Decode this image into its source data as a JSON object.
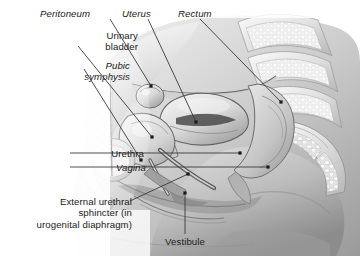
{
  "figure": {
    "type": "anatomical-illustration",
    "rendering": "grayscale pencil / airbrush medical illustration",
    "width": 360,
    "height": 256,
    "background_color": "#ffffff",
    "ink_color": "#1b1b1b",
    "leader_color": "#3a3a3a",
    "tone_light": "#f2f2f2",
    "tone_mid": "#c9c9c9",
    "tone_dark": "#8e8e8e",
    "tone_deep": "#5e5e5e"
  },
  "labels": [
    {
      "id": "peritoneum",
      "text": "Peritoneum",
      "style": "italic",
      "align": "left",
      "x": 40,
      "y": 8,
      "leader": {
        "from": [
          110,
          19
        ],
        "to": [
          151,
          86
        ],
        "dot": true
      }
    },
    {
      "id": "uterus",
      "text": "Uterus",
      "style": "italic",
      "align": "left",
      "x": 122,
      "y": 8,
      "leader": {
        "from": [
          148,
          19
        ],
        "to": [
          196,
          122
        ],
        "dot": true
      }
    },
    {
      "id": "rectum",
      "text": "Rectum",
      "style": "italic",
      "align": "left",
      "x": 178,
      "y": 8,
      "leader": {
        "from": [
          200,
          19
        ],
        "to": [
          281,
          102
        ],
        "dot": true
      }
    },
    {
      "id": "urinary-bladder",
      "text": "Urinary\nbladder",
      "lines": [
        "Urinary",
        "bladder"
      ],
      "style": "normal",
      "align": "right",
      "x": 18,
      "y": 30,
      "leader": {
        "from": [
          78,
          46
        ],
        "to": [
          152,
          137
        ],
        "dot": true
      }
    },
    {
      "id": "pubic-symphysis",
      "text": "Pubic\nsymphysis",
      "lines": [
        "Pubic",
        "symphysis"
      ],
      "style": "italic",
      "align": "right",
      "x": 10,
      "y": 60,
      "leader": {
        "from": [
          84,
          69
        ],
        "to": [
          141,
          160
        ],
        "dot": true
      }
    },
    {
      "id": "urethra",
      "text": "Urethra",
      "style": "normal",
      "align": "right",
      "x": 24,
      "y": 148,
      "leader": {
        "from": [
          70,
          153
        ],
        "to": [
          240,
          153
        ],
        "dot": true
      }
    },
    {
      "id": "vagina",
      "text": "Vagina",
      "style": "italic",
      "align": "right",
      "x": 26,
      "y": 162,
      "leader": {
        "from": [
          70,
          167
        ],
        "to": [
          268,
          167
        ],
        "dot": true
      }
    },
    {
      "id": "external-urethral-sphincter",
      "text": "External urethral\nsphincter (in\nurogenital diaphragm)",
      "lines": [
        "External urethral",
        "sphincter (in",
        "urogenital diaphragm)"
      ],
      "style": "normal",
      "align": "right",
      "x": 12,
      "y": 196,
      "leader": {
        "from": [
          130,
          201
        ],
        "to": [
          188,
          174
        ],
        "dot": true
      }
    },
    {
      "id": "vestibule",
      "text": "Vestibule",
      "style": "normal",
      "align": "center",
      "x": 160,
      "y": 236,
      "leader": {
        "from": [
          185,
          234
        ],
        "to": [
          185,
          193
        ],
        "dot": true
      }
    }
  ],
  "structures": [
    {
      "id": "peritoneum",
      "name": "Peritoneum"
    },
    {
      "id": "uterus",
      "name": "Uterus"
    },
    {
      "id": "rectum",
      "name": "Rectum"
    },
    {
      "id": "urinary-bladder",
      "name": "Urinary bladder"
    },
    {
      "id": "pubic-symphysis",
      "name": "Pubic symphysis"
    },
    {
      "id": "urethra",
      "name": "Urethra"
    },
    {
      "id": "vagina",
      "name": "Vagina"
    },
    {
      "id": "external-urethral-sphincter",
      "name": "External urethral sphincter (in urogenital diaphragm)"
    },
    {
      "id": "vestibule",
      "name": "Vestibule"
    },
    {
      "id": "sacrum",
      "name": "Sacrum and coccyx (unlabeled)"
    },
    {
      "id": "lumbar-vertebrae",
      "name": "Lumbar vertebrae (unlabeled)"
    }
  ]
}
